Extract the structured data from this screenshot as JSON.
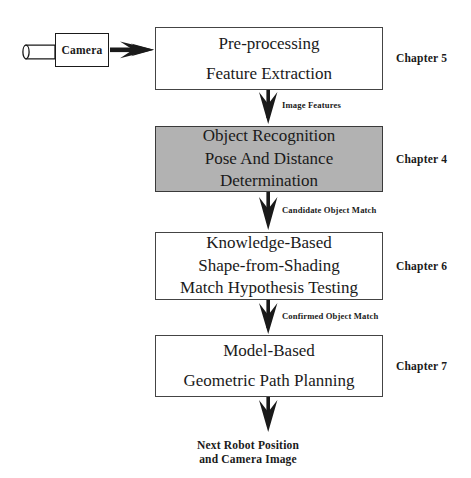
{
  "diagram": {
    "title_text_absent": "",
    "colors": {
      "shaded_box_fill": "#b2b2b2",
      "box_border": "#444444",
      "stroke": "#1a1a1a",
      "background": "#ffffff"
    },
    "source_node": {
      "label": "Camera",
      "icon": "camera-icon"
    },
    "boxes": [
      {
        "id": "preprocessing",
        "lines": [
          "Pre-processing",
          "Feature Extraction"
        ],
        "shaded": false,
        "chapter": "Chapter 5"
      },
      {
        "id": "object-recognition",
        "lines": [
          "Object Recognition",
          "Pose And Distance",
          "Determination"
        ],
        "shaded": true,
        "chapter": "Chapter 4"
      },
      {
        "id": "knowledge-based",
        "lines": [
          "Knowledge-Based",
          "Shape-from-Shading",
          "Match Hypothesis Testing"
        ],
        "shaded": false,
        "chapter": "Chapter 6"
      },
      {
        "id": "model-based",
        "lines": [
          "Model-Based",
          "Geometric Path Planning"
        ],
        "shaded": false,
        "chapter": "Chapter 7"
      }
    ],
    "edge_labels": [
      {
        "id": "image-features",
        "text": "Image Features"
      },
      {
        "id": "candidate-object-match",
        "text": "Candidate Object Match"
      },
      {
        "id": "confirmed-object-match",
        "text": "Confirmed Object Match"
      }
    ],
    "output": {
      "line1": "Next Robot Position",
      "line2": "and Camera Image"
    }
  }
}
